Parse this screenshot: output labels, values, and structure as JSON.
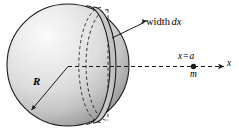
{
  "figure": {
    "background_color": "#ffffff",
    "stroke_color": "#1a1a1a",
    "sphere": {
      "fill_light": "#f2f2f2",
      "fill_mid": "#d9d9d9",
      "fill_dark": "#9a9a9a",
      "radius_px": 61,
      "center_x_px": 68,
      "center_y_px": 65
    },
    "labels": {
      "width": "width",
      "dx": "dx",
      "radius": "R",
      "position_x": "x",
      "position_equals": "=",
      "position_a": "a",
      "mass": "m",
      "axis": "x"
    }
  }
}
